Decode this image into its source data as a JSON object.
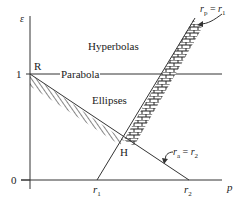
{
  "diagram": {
    "axes": {
      "y_label": "ε",
      "x_label": "p",
      "y_ticks": [
        {
          "label": "1",
          "value": 1
        },
        {
          "label": "0",
          "value": 0
        }
      ],
      "x_ticks": [
        {
          "label": "r",
          "sub": "1"
        },
        {
          "label": "r",
          "sub": "2"
        }
      ]
    },
    "regions": {
      "hyperbolas": "Hyperbolas",
      "parabola": "Parabola",
      "ellipses": "Ellipses"
    },
    "points": {
      "R": "R",
      "H": "H"
    },
    "annotations": {
      "rp_eq_r1": {
        "lhs": "r",
        "lhs_sub": "p",
        "eq": " = ",
        "rhs": "r",
        "rhs_sub": "1"
      },
      "ra_eq_r2": {
        "lhs": "r",
        "lhs_sub": "a",
        "eq": " = ",
        "rhs": "r",
        "rhs_sub": "2"
      }
    },
    "colors": {
      "line": "#333333",
      "hatch": "#222222",
      "background": "#ffffff"
    }
  }
}
